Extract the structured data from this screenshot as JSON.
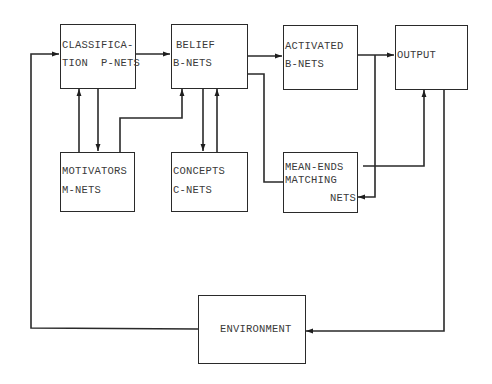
{
  "diagram": {
    "type": "block-flow",
    "colors": {
      "stroke": "#2a2a2a",
      "text": "#3a3a3a",
      "background": "#ffffff"
    },
    "nodes": {
      "classification": {
        "line1": "CLASSIFICA-",
        "line2": "TION  P-NETS"
      },
      "belief": {
        "line1": "BELIEF",
        "line2": "B-NETS"
      },
      "activated": {
        "line1": "ACTIVATED",
        "line2": "B-NETS"
      },
      "output": {
        "line1": "OUTPUT"
      },
      "motivators": {
        "line1": "MOTIVATORS",
        "line2": "M-NETS"
      },
      "concepts": {
        "line1": "CONCEPTS",
        "line2": "C-NETS"
      },
      "mean_ends": {
        "line1": "MEAN-ENDS",
        "line2": "MATCHING",
        "line3": "NETS"
      },
      "environment": {
        "line1": "ENVIRONMENT"
      }
    },
    "edges": [
      {
        "from": "CLASSIFICATION P-NETS",
        "to": "BELIEF B-NETS"
      },
      {
        "from": "BELIEF B-NETS",
        "to": "ACTIVATED B-NETS"
      },
      {
        "from": "ACTIVATED B-NETS",
        "to": "OUTPUT"
      },
      {
        "from": "ACTIVATED B-NETS",
        "to": "MEAN-ENDS MATCHING NETS"
      },
      {
        "from": "BELIEF B-NETS",
        "to": "MEAN-ENDS MATCHING NETS"
      },
      {
        "from": "MEAN-ENDS MATCHING NETS",
        "to": "OUTPUT"
      },
      {
        "from": "MOTIVATORS M-NETS",
        "to": "CLASSIFICATION P-NETS"
      },
      {
        "from": "CLASSIFICATION P-NETS",
        "to": "MOTIVATORS M-NETS"
      },
      {
        "from": "MOTIVATORS M-NETS",
        "to": "BELIEF B-NETS"
      },
      {
        "from": "BELIEF B-NETS",
        "to": "CONCEPTS C-NETS"
      },
      {
        "from": "CONCEPTS C-NETS",
        "to": "BELIEF B-NETS"
      },
      {
        "from": "OUTPUT",
        "to": "ENVIRONMENT"
      },
      {
        "from": "ENVIRONMENT",
        "to": "CLASSIFICATION P-NETS"
      }
    ]
  }
}
